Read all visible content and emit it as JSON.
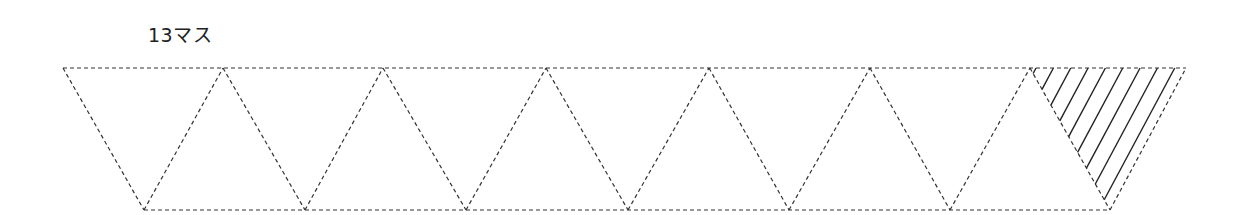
{
  "caption": "13マス",
  "diagram": {
    "type": "triangle-strip",
    "cell_count": 13,
    "top_y": 68,
    "bottom_y": 210,
    "top_vertices_x": [
      63,
      223,
      383,
      546,
      709,
      870,
      1030,
      1186
    ],
    "bottom_vertices_x": [
      144,
      305,
      466,
      628,
      789,
      950,
      1110
    ],
    "shaded_cell": {
      "description": "last downward triangle, hatched",
      "vertices": [
        [
          1030,
          68
        ],
        [
          1186,
          68
        ],
        [
          1110,
          210
        ]
      ],
      "hatch_count": 9
    },
    "line_style": "dashed",
    "line_color": "#333333",
    "hatch_color": "#222222"
  }
}
